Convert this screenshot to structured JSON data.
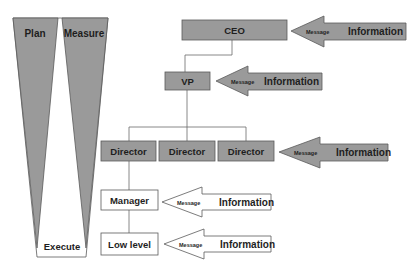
{
  "colors": {
    "gray_fill": "#9a9a9a",
    "stroke": "#5a5a5a",
    "white_fill": "#ffffff",
    "text": "#1e1e1e"
  },
  "funnel": {
    "left_label": "Plan",
    "right_label": "Measure",
    "bottom_label": "Execute"
  },
  "org": {
    "ceo": "CEO",
    "vp": "VP",
    "directors": [
      "Director",
      "Director",
      "Director"
    ],
    "manager": "Manager",
    "low_level": "Low level"
  },
  "arrows": [
    {
      "level": "ceo",
      "small": "Message",
      "large": "Information",
      "filled": true
    },
    {
      "level": "vp",
      "small": "Message",
      "large": "Information",
      "filled": true
    },
    {
      "level": "director",
      "small": "Message",
      "large": "Information",
      "filled": true
    },
    {
      "level": "manager",
      "small": "Message",
      "large": "Information",
      "filled": false
    },
    {
      "level": "low_level",
      "small": "Message",
      "large": "Information",
      "filled": false
    }
  ]
}
